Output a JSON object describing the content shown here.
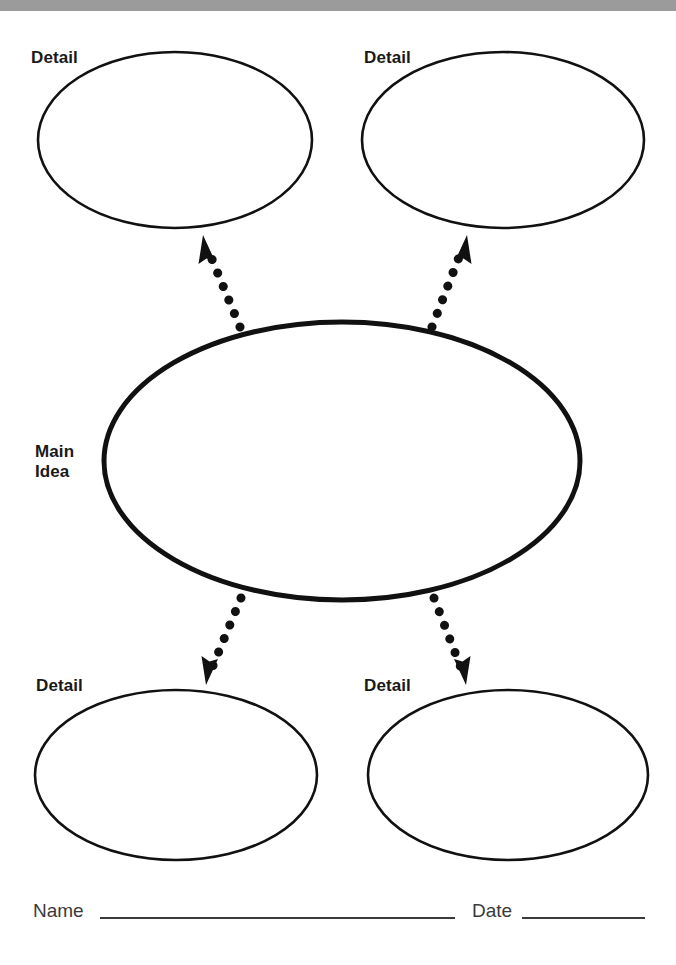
{
  "page": {
    "width": 676,
    "height": 965,
    "background_color": "#ffffff",
    "ink_color": "#111111",
    "top_band_color": "#9b9b9b"
  },
  "diagram": {
    "type": "main-idea-web",
    "center": {
      "label": "Main\nIdea",
      "label_lines": [
        "Main",
        "Idea"
      ],
      "shape": "ellipse",
      "cx": 342,
      "cy": 461,
      "rx": 238,
      "ry": 139,
      "stroke_width": 5,
      "fill": "none"
    },
    "nodes": [
      {
        "id": "detail-top-left",
        "label": "Detail",
        "shape": "ellipse",
        "cx": 175,
        "cy": 140,
        "rx": 137,
        "ry": 88,
        "stroke_width": 2.6,
        "fill": "none"
      },
      {
        "id": "detail-top-right",
        "label": "Detail",
        "shape": "ellipse",
        "cx": 503,
        "cy": 140,
        "rx": 141,
        "ry": 88,
        "stroke_width": 2.6,
        "fill": "none"
      },
      {
        "id": "detail-bottom-left",
        "label": "Detail",
        "shape": "ellipse",
        "cx": 176,
        "cy": 775,
        "rx": 141,
        "ry": 85,
        "stroke_width": 2.6,
        "fill": "none"
      },
      {
        "id": "detail-bottom-right",
        "label": "Detail",
        "shape": "ellipse",
        "cx": 508,
        "cy": 775,
        "rx": 140,
        "ry": 85,
        "stroke_width": 2.6,
        "fill": "none"
      }
    ],
    "connectors": [
      {
        "id": "arrow-to-top-left",
        "style": "dotted",
        "from": [
          240,
          327
        ],
        "to": [
          203,
          238
        ],
        "direction": "up-left",
        "dot_count": 7,
        "dot_radius": 4.6,
        "arrowhead": "filled-triangle"
      },
      {
        "id": "arrow-to-top-right",
        "style": "dotted",
        "from": [
          432,
          327
        ],
        "to": [
          466,
          238
        ],
        "direction": "up-right",
        "dot_count": 7,
        "dot_radius": 4.6,
        "arrowhead": "filled-triangle"
      },
      {
        "id": "arrow-to-bottom-left",
        "style": "dotted",
        "from": [
          241,
          598
        ],
        "to": [
          207,
          681
        ],
        "direction": "down-left",
        "dot_count": 7,
        "dot_radius": 4.6,
        "arrowhead": "filled-triangle"
      },
      {
        "id": "arrow-to-bottom-right",
        "style": "dotted",
        "from": [
          434,
          598
        ],
        "to": [
          465,
          681
        ],
        "direction": "down-right",
        "dot_count": 7,
        "dot_radius": 4.6,
        "arrowhead": "filled-triangle"
      }
    ]
  },
  "footer": {
    "name_label": "Name",
    "date_label": "Date",
    "name_rule": {
      "x1": 100,
      "x2": 455,
      "y": 918
    },
    "date_rule": {
      "x1": 522,
      "x2": 645,
      "y": 918
    },
    "rule_color": "#3a3a3a"
  }
}
